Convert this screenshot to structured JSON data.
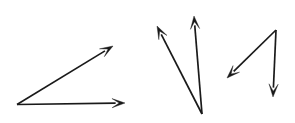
{
  "figure": {
    "background_color": "#ffffff",
    "stroke_color": "#1a1a1a",
    "stroke_width": 1.7,
    "canvas": {
      "width": 295,
      "height": 123
    },
    "angles": [
      {
        "id": "angle-left",
        "name": "acute-angle-opening-right",
        "vertex": {
          "x": 17,
          "y": 104.5
        },
        "rays": [
          {
            "id": "ray-left-upper",
            "name": "ray-up-right",
            "tip": {
              "x": 113,
              "y": 46
            },
            "arrowhead": "open-barbed",
            "arrow_length": 13,
            "arrow_half_width": 4.6
          },
          {
            "id": "ray-left-lower",
            "name": "ray-right-horizontal",
            "tip": {
              "x": 125,
              "y": 103
            },
            "arrowhead": "open-barbed",
            "arrow_length": 13,
            "arrow_half_width": 4.6
          }
        ]
      },
      {
        "id": "angle-middle",
        "name": "narrow-angle-opening-up",
        "vertex": {
          "x": 202,
          "y": 114
        },
        "rays": [
          {
            "id": "ray-middle-left",
            "name": "ray-up-left",
            "tip": {
              "x": 157,
              "y": 26
            },
            "arrowhead": "open-barbed",
            "arrow_length": 13,
            "arrow_half_width": 4.6
          },
          {
            "id": "ray-middle-vertical",
            "name": "ray-up-vertical",
            "tip": {
              "x": 194,
              "y": 16
            },
            "arrowhead": "open-barbed",
            "arrow_length": 13,
            "arrow_half_width": 4.6
          }
        ]
      },
      {
        "id": "angle-right",
        "name": "angle-opening-down-left",
        "vertex": {
          "x": 276,
          "y": 30
        },
        "rays": [
          {
            "id": "ray-right-diagonal",
            "name": "ray-down-left",
            "tip": {
              "x": 227,
              "y": 78
            },
            "arrowhead": "open-barbed",
            "arrow_length": 13,
            "arrow_half_width": 4.6
          },
          {
            "id": "ray-right-vertical",
            "name": "ray-down-vertical",
            "tip": {
              "x": 273,
              "y": 97
            },
            "arrowhead": "open-barbed",
            "arrow_length": 13,
            "arrow_half_width": 4.6
          }
        ]
      }
    ]
  }
}
